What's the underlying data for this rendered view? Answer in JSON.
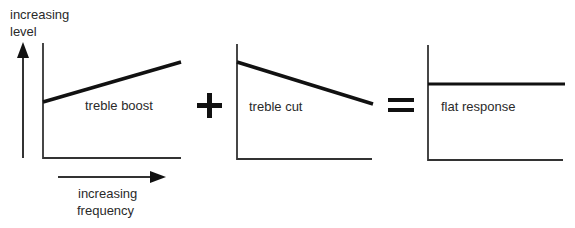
{
  "diagram": {
    "axis_labels": {
      "y_line1": "increasing",
      "y_line2": "level",
      "x_line1": "increasing",
      "x_line2": "frequency"
    },
    "panels": [
      {
        "id": "boost",
        "label": "treble boost",
        "curve": "rising"
      },
      {
        "id": "cut",
        "label": "treble cut",
        "curve": "falling"
      },
      {
        "id": "flat",
        "label": "flat response",
        "curve": "flat"
      }
    ],
    "operators": [
      "+",
      "="
    ],
    "colors": {
      "line": "#111111",
      "axis": "#333333",
      "text": "#2a2a2a",
      "background": "#ffffff"
    }
  }
}
